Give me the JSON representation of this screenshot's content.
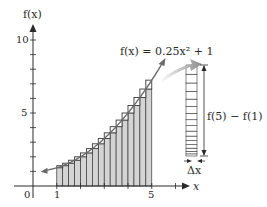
{
  "chart_data": {
    "type": "area",
    "title": "",
    "function_label": "f(x) = 0.25x² + 1",
    "function": {
      "a": 0.25,
      "b": 0,
      "c": 1
    },
    "xlabel": "x",
    "ylabel": "f(x)",
    "xlim": [
      0,
      6.2
    ],
    "ylim": [
      0,
      10.8
    ],
    "x_ticks_labeled": [
      {
        "value": 0,
        "label": "0"
      },
      {
        "value": 1,
        "label": "1"
      },
      {
        "value": 5,
        "label": "5"
      }
    ],
    "y_ticks_labeled": [
      {
        "value": 5,
        "label": "5"
      },
      {
        "value": 10,
        "label": "10"
      }
    ],
    "y_minor_ticks": [
      1,
      2,
      3,
      4,
      5,
      6,
      7,
      8,
      9,
      10
    ],
    "x_minor_ticks": [
      1,
      2,
      3,
      4,
      5,
      6
    ],
    "rectangles": {
      "count": 16,
      "start": 1,
      "end": 5,
      "dx": 0.25,
      "x_left": [
        1,
        1.25,
        1.5,
        1.75,
        2,
        2.25,
        2.5,
        2.75,
        3,
        3.25,
        3.5,
        3.75,
        4,
        4.25,
        4.5,
        4.75
      ],
      "heights": [
        1.25,
        1.39,
        1.56,
        1.77,
        2.0,
        2.27,
        2.56,
        2.89,
        3.25,
        3.64,
        4.06,
        4.52,
        5.0,
        5.52,
        6.06,
        6.64
      ]
    },
    "annotations": {
      "difference_label": "f(5) − f(1)",
      "dx_label": "Δx",
      "difference_value": 6
    },
    "grid": false,
    "legend": null
  },
  "labels": {
    "y_axis": "f(x)",
    "x_axis": "x",
    "function": "f(x) = 0.25x² + 1",
    "origin": "0",
    "x1": "1",
    "x5": "5",
    "y5": "5",
    "y10": "10",
    "difference": "f(5) − f(1)",
    "dx": "Δx"
  },
  "colors": {
    "axis": "#2a2a2a",
    "rect_fill": "#d4d4d4",
    "rect_stroke": "#3a3a3a",
    "curve": "#6a6a6a",
    "arrow_gradient_start": "#ffffff",
    "arrow_gradient_end": "#8a8a8a"
  }
}
